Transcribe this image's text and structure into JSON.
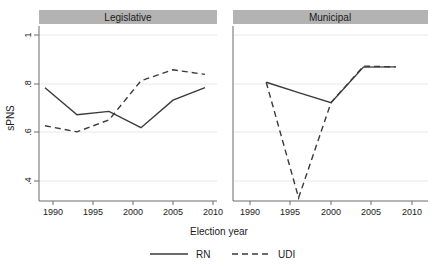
{
  "figure": {
    "ylabel": "sPNS",
    "xlabel": "Election year",
    "panels": [
      {
        "title": "Legislative"
      },
      {
        "title": "Municipal"
      }
    ],
    "legend": {
      "entries": [
        {
          "label": "RN",
          "style": "solid"
        },
        {
          "label": "UDI",
          "style": "dashed"
        }
      ]
    },
    "y_ticks": [
      "1",
      ".8",
      ".6",
      ".4"
    ],
    "x_ticks_left": [
      "1990",
      "1995",
      "2000",
      "2005",
      "2010"
    ],
    "x_ticks_right": [
      "1990",
      "1995",
      "2000",
      "2005",
      "2010"
    ],
    "colors": {
      "line": "#3a3a3a",
      "grid": "#e8e8e8",
      "axis": "#6a6a6a",
      "panel_header": "#b3b3b3",
      "background": "#ffffff"
    }
  },
  "chart_data": {
    "type": "line",
    "title": "",
    "xlabel": "Election year",
    "ylabel": "sPNS",
    "ylim": [
      0.3,
      1.05
    ],
    "xlim": [
      1988,
      2011
    ],
    "y_tick_values": [
      0.4,
      0.6,
      0.8,
      1.0
    ],
    "x_tick_values": [
      1990,
      1995,
      2000,
      2005,
      2010
    ],
    "grid": true,
    "legend_position": "bottom",
    "panels": [
      {
        "title": "Legislative",
        "series": [
          {
            "name": "RN",
            "style": "solid",
            "x": [
              1989,
              1993,
              1997,
              2001,
              2005,
              2009
            ],
            "values": [
              0.783,
              0.672,
              0.686,
              0.619,
              0.732,
              0.784
            ]
          },
          {
            "name": "UDI",
            "style": "dashed",
            "x": [
              1989,
              1993,
              1997,
              2001,
              2005,
              2009
            ],
            "values": [
              0.627,
              0.602,
              0.651,
              0.812,
              0.857,
              0.838
            ]
          }
        ]
      },
      {
        "title": "Municipal",
        "series": [
          {
            "name": "RN",
            "style": "solid",
            "x": [
              1992,
              1996,
              2000,
              2004,
              2008
            ],
            "values": [
              0.806,
              0.763,
              0.722,
              0.868,
              0.869
            ]
          },
          {
            "name": "UDI",
            "style": "dashed",
            "x": [
              1992,
              1996,
              2000,
              2004,
              2008
            ],
            "values": [
              0.806,
              0.331,
              0.722,
              0.872,
              0.869
            ]
          }
        ]
      }
    ]
  }
}
